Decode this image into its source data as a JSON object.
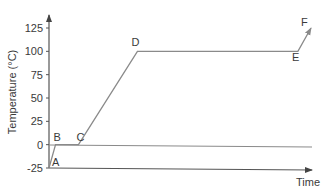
{
  "chart_data": {
    "type": "line",
    "title": "",
    "xlabel": "Time",
    "ylabel": "Temperature (°C)",
    "ylim": [
      -25,
      125
    ],
    "yticks": [
      -25,
      0,
      25,
      50,
      75,
      100,
      125
    ],
    "ytick_labels": [
      "-25",
      "0",
      "25",
      "50",
      "75",
      "100",
      "125"
    ],
    "grid": false,
    "legend": null,
    "points": [
      {
        "label": "A",
        "t": 0,
        "temp": -25
      },
      {
        "label": "B",
        "t": 1,
        "temp": 0
      },
      {
        "label": "C",
        "t": 4.5,
        "temp": 0
      },
      {
        "label": "D",
        "t": 13.5,
        "temp": 100
      },
      {
        "label": "E",
        "t": 38,
        "temp": 100
      },
      {
        "label": "F",
        "t": 40,
        "temp": 125
      }
    ],
    "annotations": [
      "Horizontal reference line at 0 °C spans the full width",
      "Segment E→F ends with an arrowhead"
    ]
  },
  "axes": {
    "x_label": "Time",
    "y_label": "Temperature (°C)"
  },
  "colors": {
    "line": "#8a8a8a",
    "axis": "#555555",
    "text": "#3a3a3a"
  }
}
